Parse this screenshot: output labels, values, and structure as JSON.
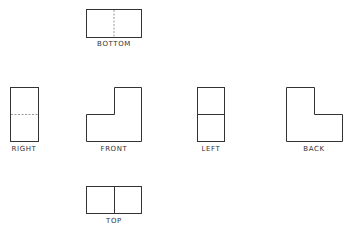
{
  "diagram": {
    "line_color": "#333333",
    "hidden_line_color": "#999999",
    "views": [
      {
        "id": "bottom",
        "label": "BOTTOM"
      },
      {
        "id": "right",
        "label": "RIGHT"
      },
      {
        "id": "front",
        "label": "FRONT"
      },
      {
        "id": "left",
        "label": "LEFT"
      },
      {
        "id": "back",
        "label": "BACK"
      },
      {
        "id": "top",
        "label": "TOP"
      }
    ]
  }
}
